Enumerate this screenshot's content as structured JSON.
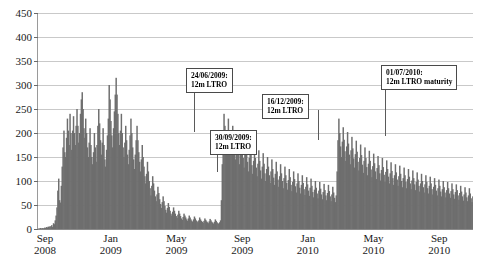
{
  "chart_data": {
    "type": "area",
    "title": "",
    "subtitle": "",
    "xlabel": "",
    "ylabel": "",
    "ylim": [
      0,
      450
    ],
    "ytick_values": [
      0,
      50,
      100,
      150,
      200,
      250,
      300,
      350,
      400,
      450
    ],
    "ytick_labels": [
      "0",
      "50",
      "100",
      "150",
      "200",
      "250",
      "300",
      "350",
      "400",
      "450"
    ],
    "grid": true,
    "legend": "none",
    "xtick_labels": [
      {
        "month": "Sep",
        "year": "2008"
      },
      {
        "month": "Jan",
        "year": "2009"
      },
      {
        "month": "May",
        "year": "2009"
      },
      {
        "month": "Sep",
        "year": "2009"
      },
      {
        "month": "Jan",
        "year": "2010"
      },
      {
        "month": "May",
        "year": "2010"
      },
      {
        "month": "Sep",
        "year": "2010"
      }
    ],
    "series_color": "#6e6e6e",
    "grid_color": "#c9c9c9",
    "axis_color": "#8a8a8a",
    "x_start": "Sep 2008",
    "x_end": "Nov 2010",
    "values": [
      1,
      1,
      2,
      1,
      2,
      1,
      2,
      3,
      2,
      4,
      3,
      5,
      4,
      6,
      5,
      8,
      4,
      12,
      10,
      18,
      28,
      45,
      80,
      105,
      60,
      55,
      90,
      130,
      170,
      205,
      160,
      150,
      190,
      230,
      205,
      175,
      240,
      200,
      165,
      205,
      235,
      200,
      175,
      215,
      250,
      215,
      180,
      200,
      240,
      270,
      285,
      250,
      210,
      190,
      230,
      200,
      170,
      150,
      180,
      210,
      175,
      150,
      135,
      160,
      200,
      170,
      140,
      175,
      215,
      250,
      220,
      185,
      155,
      180,
      210,
      175,
      145,
      130,
      165,
      195,
      230,
      300,
      270,
      225,
      195,
      170,
      210,
      245,
      280,
      315,
      280,
      240,
      200,
      175,
      205,
      240,
      200,
      170,
      150,
      180,
      215,
      185,
      155,
      135,
      165,
      195,
      230,
      200,
      170,
      145,
      125,
      155,
      185,
      215,
      185,
      160,
      140,
      120,
      145,
      175,
      150,
      130,
      110,
      95,
      115,
      140,
      120,
      100,
      85,
      70,
      90,
      110,
      95,
      80,
      68,
      58,
      72,
      88,
      75,
      62,
      52,
      44,
      56,
      68,
      58,
      48,
      40,
      34,
      44,
      54,
      46,
      38,
      32,
      28,
      36,
      45,
      38,
      32,
      27,
      23,
      30,
      38,
      32,
      27,
      22,
      19,
      25,
      32,
      28,
      24,
      20,
      17,
      22,
      28,
      24,
      20,
      17,
      15,
      20,
      26,
      22,
      18,
      16,
      14,
      18,
      24,
      20,
      17,
      15,
      13,
      17,
      22,
      19,
      16,
      14,
      12,
      16,
      21,
      18,
      15,
      13,
      11,
      15,
      20,
      17,
      14,
      12,
      11,
      14,
      18,
      60,
      135,
      205,
      240,
      215,
      185,
      165,
      200,
      230,
      200,
      175,
      155,
      185,
      215,
      190,
      165,
      145,
      175,
      205,
      180,
      155,
      135,
      165,
      195,
      170,
      148,
      128,
      155,
      185,
      160,
      140,
      120,
      148,
      178,
      155,
      133,
      115,
      142,
      170,
      148,
      128,
      110,
      136,
      164,
      142,
      122,
      105,
      130,
      158,
      136,
      116,
      100,
      125,
      150,
      130,
      112,
      96,
      120,
      145,
      125,
      107,
      92,
      115,
      140,
      120,
      103,
      88,
      110,
      135,
      116,
      100,
      85,
      106,
      130,
      112,
      96,
      82,
      102,
      125,
      108,
      92,
      79,
      98,
      120,
      104,
      89,
      76,
      95,
      116,
      100,
      86,
      74,
      92,
      112,
      96,
      83,
      71,
      88,
      108,
      93,
      80,
      69,
      86,
      105,
      90,
      77,
      66,
      82,
      100,
      86,
      74,
      64,
      80,
      98,
      84,
      72,
      62,
      77,
      94,
      81,
      70,
      60,
      75,
      92,
      79,
      68,
      58,
      72,
      88,
      76,
      65,
      56,
      70,
      120,
      185,
      230,
      200,
      172,
      150,
      182,
      212,
      186,
      162,
      142,
      172,
      202,
      178,
      155,
      135,
      164,
      192,
      168,
      147,
      128,
      156,
      184,
      161,
      140,
      122,
      148,
      176,
      154,
      134,
      117,
      142,
      170,
      148,
      129,
      112,
      136,
      163,
      142,
      124,
      108,
      131,
      157,
      137,
      120,
      104,
      127,
      152,
      133,
      116,
      101,
      123,
      148,
      129,
      113,
      98,
      119,
      143,
      125,
      109,
      95,
      116,
      139,
      121,
      106,
      92,
      112,
      135,
      118,
      103,
      90,
      110,
      132,
      115,
      100,
      87,
      106,
      128,
      112,
      98,
      85,
      104,
      125,
      109,
      95,
      83,
      101,
      122,
      106,
      93,
      81,
      98,
      118,
      103,
      90,
      78,
      95,
      115,
      100,
      87,
      76,
      93,
      112,
      98,
      85,
      74,
      90,
      109,
      95,
      83,
      72,
      88,
      106,
      92,
      80,
      70,
      85,
      103,
      90,
      78,
      68,
      83,
      100,
      87,
      76,
      66,
      81,
      98,
      85,
      74,
      65,
      79,
      95,
      83,
      72,
      63,
      77,
      93,
      81,
      70,
      61,
      75,
      90,
      78,
      68,
      59,
      72,
      87,
      76,
      66,
      58,
      70,
      85,
      74,
      64,
      56,
      68
    ]
  },
  "annotations": [
    {
      "id": "annot-24-06-2009",
      "line1": "24/06/2009:",
      "line2": "12m LTRO",
      "box_left": 186,
      "box_top": 68,
      "leader_x": 194,
      "leader_top": 88,
      "leader_height": 44
    },
    {
      "id": "annot-30-09-2009",
      "line1": "30/09/2009:",
      "line2": "12m LTRO",
      "box_left": 210,
      "box_top": 130,
      "leader_x": 217,
      "leader_top": 150,
      "leader_height": 22
    },
    {
      "id": "annot-16-12-2009",
      "line1": "16/12/2009:",
      "line2": "12m LTRO",
      "box_left": 262,
      "box_top": 94,
      "leader_x": 318,
      "leader_top": 110,
      "leader_height": 30
    },
    {
      "id": "annot-01-07-2010",
      "line1": "01/07/2010:",
      "line2": "12m LTRO maturity",
      "box_left": 381,
      "box_top": 65,
      "leader_x": 385,
      "leader_top": 88,
      "leader_height": 48
    }
  ]
}
